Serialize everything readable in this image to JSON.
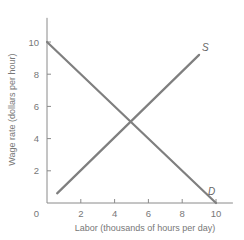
{
  "chart_data": {
    "type": "line",
    "title": "",
    "xlabel": "Labor (thousands of hours per day)",
    "ylabel": "Wage rate (dollars per hour)",
    "xlim": [
      0,
      11
    ],
    "ylim": [
      0,
      11.5
    ],
    "grid": false,
    "legend": "none",
    "x_ticks": [
      2,
      4,
      6,
      8,
      10
    ],
    "y_ticks": [
      2,
      4,
      6,
      8,
      10
    ],
    "origin_label": "0",
    "series": [
      {
        "name": "S",
        "label": "S",
        "x": [
          0.6,
          9.0
        ],
        "y": [
          0.6,
          9.2
        ]
      },
      {
        "name": "D",
        "label": "D",
        "x": [
          0,
          10
        ],
        "y": [
          10,
          0
        ]
      }
    ],
    "color": "#7f7f7f",
    "equilibrium": {
      "x": 5,
      "y": 5
    }
  }
}
